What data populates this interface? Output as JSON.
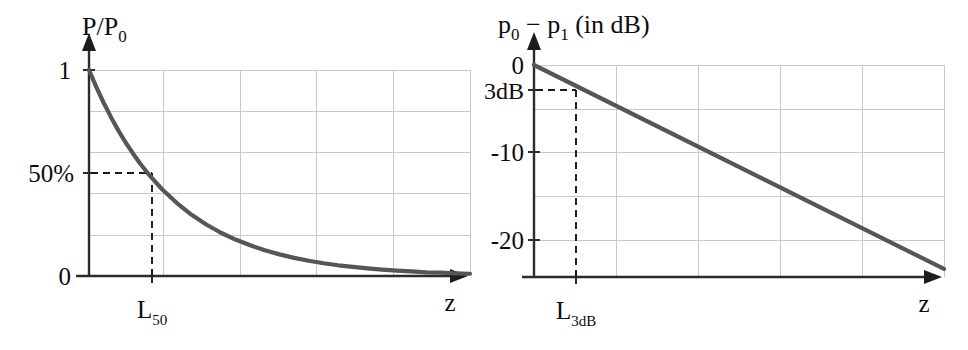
{
  "figure": {
    "background_color": "#ffffff",
    "curve_color": "#565656",
    "axis_color": "#2b2b2b",
    "grid_color": "#c9c9c9",
    "dash_color": "#1a1a1a"
  },
  "chart_data": [
    {
      "type": "line",
      "panel": "left",
      "title": "",
      "ylabel": "P/P",
      "ylabel_sub": "0",
      "xlabel": "z",
      "ylim": [
        0,
        1
      ],
      "xlim": [
        0,
        5.2
      ],
      "grid": true,
      "grid_y": [
        1.0,
        0.8,
        0.6,
        0.4,
        0.2
      ],
      "grid_x": [
        1.0,
        2.0,
        3.0,
        4.0,
        5.0
      ],
      "ytick_labels": [
        "1",
        "50%",
        "0"
      ],
      "ytick_values": [
        1.0,
        0.5,
        0.0
      ],
      "xtick_labels": [
        "L"
      ],
      "xtick_label_sub": "50",
      "xtick_values": [
        0.8
      ],
      "annotation": "50% crossing at L50",
      "x": [
        0,
        0.1,
        0.2,
        0.3,
        0.4,
        0.5,
        0.6,
        0.7,
        0.8,
        0.9,
        1.0,
        1.2,
        1.4,
        1.6,
        1.8,
        2.0,
        2.2,
        2.4,
        2.6,
        2.8,
        3.0,
        3.2,
        3.4,
        3.6,
        3.8,
        4.0,
        4.2,
        4.4,
        4.6,
        4.8,
        5.0,
        5.2
      ],
      "y": [
        1.0,
        0.917,
        0.841,
        0.771,
        0.707,
        0.648,
        0.595,
        0.545,
        0.5,
        0.459,
        0.42,
        0.354,
        0.297,
        0.25,
        0.21,
        0.177,
        0.149,
        0.125,
        0.105,
        0.088,
        0.074,
        0.062,
        0.052,
        0.044,
        0.037,
        0.031,
        0.026,
        0.022,
        0.018,
        0.016,
        0.013,
        0.011
      ]
    },
    {
      "type": "line",
      "panel": "right",
      "title": "",
      "ylabel": "p",
      "ylabel_parts": [
        "p",
        "0",
        " − ",
        "p",
        "1",
        " (in dB)"
      ],
      "xlabel": "z",
      "ylim": [
        -23.5,
        0
      ],
      "xlim": [
        0,
        5.2
      ],
      "grid": true,
      "grid_y": [
        0,
        -5,
        -10,
        -15,
        -20
      ],
      "grid_x": [
        1.0,
        2.0,
        3.0,
        4.0,
        5.0
      ],
      "ytick_labels": [
        "0",
        "3dB",
        "-10",
        "-20"
      ],
      "ytick_values": [
        0,
        -3,
        -10,
        -20
      ],
      "xtick_labels": [
        "L"
      ],
      "xtick_label_sub": "3dB",
      "xtick_values": [
        0.8
      ],
      "annotation": "-3 dB crossing at L3dB",
      "x": [
        0,
        5.2
      ],
      "y": [
        0,
        -22.6
      ]
    }
  ],
  "labels": {
    "left_y_title_main": "P/P",
    "left_y_title_sub": "0",
    "left_tick_1": "1",
    "left_tick_50": "50%",
    "left_tick_0": "0",
    "left_x_tick_main": "L",
    "left_x_tick_sub": "50",
    "left_x_axis": "z",
    "right_y_title_p": "p",
    "right_y_title_sub0": "0",
    "right_y_title_minus": "−",
    "right_y_title_p1": "p",
    "right_y_title_sub1": "1",
    "right_y_title_units": "(in dB)",
    "right_tick_0": "0",
    "right_tick_3db": "3dB",
    "right_tick_m10": "-10",
    "right_tick_m20": "-20",
    "right_x_tick_main": "L",
    "right_x_tick_sub": "3dB",
    "right_x_axis": "z"
  }
}
